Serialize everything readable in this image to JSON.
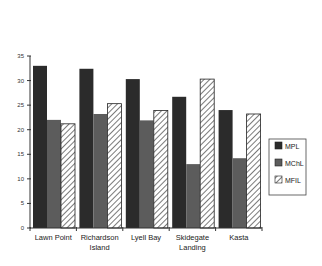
{
  "chart_data": {
    "type": "bar",
    "title": "",
    "xlabel": "",
    "ylabel": "",
    "ylim": [
      0,
      35
    ],
    "yticks": [
      0,
      5,
      10,
      15,
      20,
      25,
      30,
      35
    ],
    "grid": false,
    "legend_position": "right",
    "categories": [
      "Lawn Point",
      "Richardson Island",
      "Lyell Bay",
      "Skidegate Landing",
      "Kasta"
    ],
    "category_label_lines": [
      [
        "Lawn Point"
      ],
      [
        "Richardson",
        "Island"
      ],
      [
        "Lyell Bay"
      ],
      [
        "Skidegate",
        "Landing"
      ],
      [
        "Kasta"
      ]
    ],
    "series": [
      {
        "name": "MPL",
        "values": [
          33,
          32.4,
          30.3,
          26.7,
          24
        ],
        "color": "#2b2b2b",
        "pattern": "solid"
      },
      {
        "name": "MChL",
        "values": [
          22,
          23.2,
          21.9,
          13,
          14.2
        ],
        "color": "#5c5c5c",
        "pattern": "solid"
      },
      {
        "name": "MFIL",
        "values": [
          21.2,
          25.3,
          23.9,
          30.3,
          23.2
        ],
        "color": "#ffffff",
        "pattern": "hatch"
      }
    ]
  }
}
